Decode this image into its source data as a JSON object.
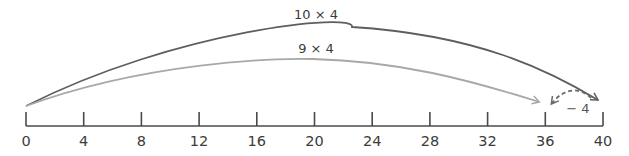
{
  "number_line": {
    "min": 0,
    "max": 40,
    "step": 4,
    "ticks": [
      {
        "value": 0,
        "label": "0"
      },
      {
        "value": 4,
        "label": "4"
      },
      {
        "value": 8,
        "label": "8"
      },
      {
        "value": 12,
        "label": "12"
      },
      {
        "value": 16,
        "label": "16"
      },
      {
        "value": 20,
        "label": "20"
      },
      {
        "value": 24,
        "label": "24"
      },
      {
        "value": 28,
        "label": "28"
      },
      {
        "value": 32,
        "label": "32"
      },
      {
        "value": 36,
        "label": "36"
      },
      {
        "value": 40,
        "label": "40"
      }
    ],
    "axis_color": "#4a4a4a"
  },
  "jumps": [
    {
      "id": "ten-times-four",
      "label": "10 × 4",
      "from": 0,
      "to": 40,
      "style": "solid",
      "color": "#5e5e5e"
    },
    {
      "id": "nine-times-four",
      "label": "9 × 4",
      "from": 0,
      "to": 36,
      "style": "solid",
      "color": "#a8a8a8"
    },
    {
      "id": "minus-four",
      "label": "− 4",
      "from": 40,
      "to": 36,
      "style": "dashed",
      "color": "#6a6a6a"
    }
  ]
}
